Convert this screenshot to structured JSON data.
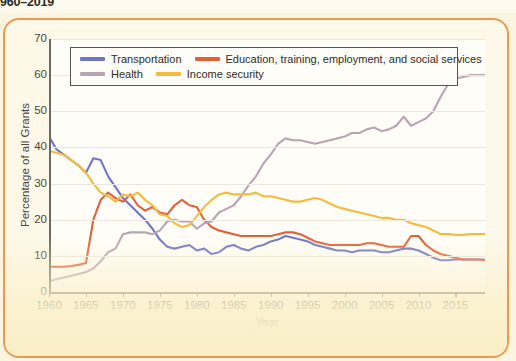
{
  "figure": {
    "title": "960–2019",
    "frame_color": "#e99a50",
    "background": "#fbf5e0",
    "plot_background": "#fffdf7"
  },
  "legend": {
    "position": "top-left-inside",
    "rows": [
      [
        {
          "label": "Transportation",
          "color": "#6f76c4",
          "key": "transportation"
        },
        {
          "label": "Education, training, employment, and social services",
          "color": "#e0613a",
          "key": "education"
        }
      ],
      [
        {
          "label": "Health",
          "color": "#b9a4b4",
          "key": "health"
        },
        {
          "label": "Income security",
          "color": "#f3bc3f",
          "key": "income_security"
        }
      ]
    ]
  },
  "chart_data": {
    "type": "line",
    "title": "960–2019",
    "xlabel": "Year",
    "ylabel": "Percentage of all Grants",
    "xlim": [
      1960,
      2019
    ],
    "ylim": [
      0,
      70
    ],
    "ytick_values": [
      0,
      10,
      20,
      30,
      40,
      50,
      60,
      70
    ],
    "ytick_labels": [
      "0",
      "10",
      "20",
      "30",
      "40",
      "50",
      "60",
      "70"
    ],
    "xtick_values": [
      1960,
      1965,
      1970,
      1975,
      1980,
      1985,
      1990,
      1995,
      2000,
      2005,
      2010,
      2015
    ],
    "xtick_labels": [
      "1960",
      "1965",
      "1970",
      "1975",
      "1980",
      "1985",
      "1990",
      "1995",
      "2000",
      "2005",
      "2010",
      "2015"
    ],
    "grid": "horizontal",
    "legend_position": "upper left",
    "x": [
      1960,
      1961,
      1962,
      1963,
      1964,
      1965,
      1966,
      1967,
      1968,
      1969,
      1970,
      1971,
      1972,
      1973,
      1974,
      1975,
      1976,
      1977,
      1978,
      1979,
      1980,
      1981,
      1982,
      1983,
      1984,
      1985,
      1986,
      1987,
      1988,
      1989,
      1990,
      1991,
      1992,
      1993,
      1994,
      1995,
      1996,
      1997,
      1998,
      1999,
      2000,
      2001,
      2002,
      2003,
      2004,
      2005,
      2006,
      2007,
      2008,
      2009,
      2010,
      2011,
      2012,
      2013,
      2014,
      2015,
      2016,
      2017,
      2018,
      2019
    ],
    "series": [
      {
        "name": "Transportation",
        "color": "#6f76c4",
        "values": [
          43.0,
          39.5,
          38.0,
          36.5,
          35.0,
          33.0,
          37.0,
          36.5,
          32.0,
          29.0,
          26.0,
          24.0,
          22.0,
          20.0,
          17.5,
          14.5,
          12.5,
          12.0,
          12.5,
          13.0,
          11.5,
          12.0,
          10.5,
          11.0,
          12.5,
          13.0,
          12.0,
          11.5,
          12.5,
          13.0,
          14.0,
          14.5,
          15.5,
          15.0,
          14.5,
          14.0,
          13.0,
          12.5,
          12.0,
          11.5,
          11.5,
          11.0,
          11.5,
          11.5,
          11.5,
          11.0,
          11.0,
          11.5,
          12.0,
          12.0,
          11.5,
          10.5,
          9.5,
          8.8,
          8.8,
          9.0,
          9.0,
          9.0,
          9.0,
          9.0
        ]
      },
      {
        "name": "Education, training, employment, and social services",
        "color": "#e0613a",
        "values": [
          7.0,
          7.0,
          7.0,
          7.2,
          7.5,
          8.0,
          20.0,
          25.5,
          27.5,
          26.0,
          25.0,
          27.0,
          24.0,
          22.5,
          23.5,
          22.0,
          21.5,
          24.0,
          25.5,
          24.0,
          23.5,
          20.0,
          18.0,
          17.0,
          16.5,
          16.0,
          15.5,
          15.5,
          15.5,
          15.5,
          15.5,
          16.0,
          16.5,
          16.5,
          16.0,
          15.0,
          14.0,
          13.5,
          13.0,
          13.0,
          13.0,
          13.0,
          13.0,
          13.5,
          13.5,
          13.0,
          12.5,
          12.5,
          12.5,
          15.5,
          15.5,
          13.0,
          11.5,
          10.5,
          10.0,
          9.5,
          9.0,
          9.0,
          9.0,
          8.8
        ]
      },
      {
        "name": "Health",
        "color": "#b9a4b4",
        "values": [
          3.0,
          3.5,
          4.0,
          4.5,
          5.0,
          5.5,
          6.5,
          8.5,
          11.0,
          12.0,
          16.0,
          16.5,
          16.5,
          16.5,
          16.0,
          17.0,
          19.5,
          20.0,
          19.5,
          19.5,
          17.5,
          19.0,
          19.5,
          22.0,
          23.0,
          24.0,
          26.5,
          29.5,
          32.0,
          35.5,
          38.0,
          41.0,
          42.5,
          42.0,
          42.0,
          41.5,
          41.0,
          41.5,
          42.0,
          42.5,
          43.0,
          44.0,
          44.0,
          45.0,
          45.5,
          44.5,
          45.0,
          46.0,
          48.5,
          46.0,
          47.0,
          48.0,
          50.0,
          54.0,
          57.5,
          59.0,
          59.5,
          60.0,
          60.0,
          60.0
        ]
      },
      {
        "name": "Income security",
        "color": "#f3bc3f",
        "values": [
          39.0,
          38.5,
          38.0,
          36.5,
          35.0,
          33.0,
          30.0,
          27.5,
          26.5,
          25.0,
          27.0,
          26.5,
          27.5,
          25.5,
          24.0,
          21.5,
          21.0,
          19.0,
          18.0,
          18.5,
          21.0,
          23.5,
          25.5,
          27.0,
          27.5,
          27.0,
          27.0,
          27.0,
          27.5,
          26.5,
          26.5,
          26.0,
          25.5,
          25.0,
          25.0,
          25.5,
          26.0,
          25.5,
          24.5,
          23.5,
          23.0,
          22.5,
          22.0,
          21.5,
          21.0,
          20.5,
          20.5,
          20.0,
          20.0,
          19.0,
          18.5,
          18.0,
          17.0,
          16.0,
          16.0,
          15.8,
          15.8,
          16.0,
          16.0,
          16.0
        ]
      }
    ]
  }
}
